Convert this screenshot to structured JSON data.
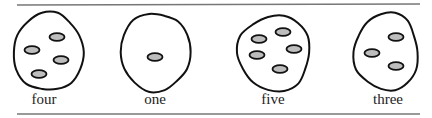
{
  "diagram": {
    "title": "",
    "colors": {
      "line": "#777777",
      "outline": "#111111",
      "dot_fill": "#bdbdbd",
      "text": "#222222"
    },
    "rules": [
      {
        "x1": 17,
        "y1": 5,
        "x2": 420,
        "y2": 4
      },
      {
        "x1": 17,
        "y1": 114,
        "x2": 420,
        "y2": 114
      }
    ],
    "groups": [
      {
        "label": "four",
        "count": 4,
        "label_x": 44,
        "blob": {
          "cx": 50,
          "cy": 52,
          "rx": 35,
          "ry": 39
        },
        "dots": [
          {
            "cx": 57,
            "cy": 37
          },
          {
            "cx": 32,
            "cy": 50
          },
          {
            "cx": 61,
            "cy": 60
          },
          {
            "cx": 39,
            "cy": 74
          }
        ]
      },
      {
        "label": "one",
        "count": 1,
        "label_x": 155,
        "blob": {
          "cx": 157,
          "cy": 52,
          "rx": 35,
          "ry": 39
        },
        "dots": [
          {
            "cx": 155,
            "cy": 57
          }
        ]
      },
      {
        "label": "five",
        "count": 5,
        "label_x": 273,
        "blob": {
          "cx": 276,
          "cy": 53,
          "rx": 36,
          "ry": 38
        },
        "dots": [
          {
            "cx": 259,
            "cy": 39
          },
          {
            "cx": 283,
            "cy": 32
          },
          {
            "cx": 294,
            "cy": 49
          },
          {
            "cx": 257,
            "cy": 55
          },
          {
            "cx": 280,
            "cy": 69
          }
        ]
      },
      {
        "label": "three",
        "count": 3,
        "label_x": 388,
        "blob": {
          "cx": 388,
          "cy": 52,
          "rx": 32,
          "ry": 39
        },
        "dots": [
          {
            "cx": 396,
            "cy": 37
          },
          {
            "cx": 372,
            "cy": 53
          },
          {
            "cx": 396,
            "cy": 66
          }
        ]
      }
    ]
  }
}
